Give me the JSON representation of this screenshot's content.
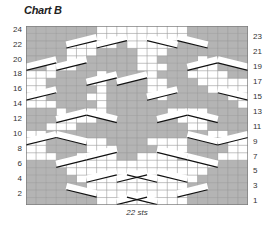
{
  "chart": {
    "title": "Chart B",
    "stitch_count_label": "22 sts",
    "columns": 22,
    "rows": 24,
    "colors": {
      "shade": "#b4b4b4",
      "background": "#ffffff",
      "grid": "#9a9a9a",
      "grid_on_shade": "#6e6e6e",
      "cable_line": "#111111"
    },
    "row_labels_left": [
      "24",
      "22",
      "20",
      "18",
      "16",
      "14",
      "12",
      "10",
      "8",
      "6",
      "4",
      "2"
    ],
    "row_labels_right": [
      "23",
      "21",
      "19",
      "17",
      "15",
      "13",
      "11",
      "9",
      "7",
      "5",
      "3",
      "1"
    ],
    "shading_rows_top_to_bottom": [
      "1111111000000000111111",
      "1111111000000000111111",
      "1111000001000001111111",
      "1111000111100011111111",
      "1111001111100111101111",
      "1100011111100011100111",
      "0001111011110111000011",
      "0011110011110011100000",
      "0011111011110011110000",
      "0011110011111011111100",
      "0001111011111111111110",
      "1110110011111100001111",
      "1110000111111110001111",
      "1100011111111111001111",
      "0011111111111111110011",
      "0011110011110000111100",
      "0011110001111000111100",
      "0001100001100001111000",
      "1110000000000000000111",
      "1111000000000000001111",
      "1111100000000000011111",
      "1111110000000000111111",
      "1111111000000000111111",
      "1111111000000000111111"
    ],
    "cable_segments": [
      [
        4,
        2.5,
        7,
        1.5
      ],
      [
        7,
        2.5,
        10,
        1.5
      ],
      [
        12,
        1.5,
        15,
        2.5
      ],
      [
        15,
        1.5,
        18,
        2.5
      ],
      [
        0,
        5.5,
        3,
        4.5
      ],
      [
        3,
        5.5,
        6,
        4.5
      ],
      [
        16,
        5.5,
        19,
        4.5
      ],
      [
        19,
        4.5,
        22,
        5.5
      ],
      [
        9,
        7.5,
        12,
        6.5
      ],
      [
        6,
        7.5,
        9,
        6.5
      ],
      [
        0,
        9.5,
        3,
        8.5
      ],
      [
        12,
        9.5,
        15,
        8.5
      ],
      [
        19,
        8.5,
        22,
        9.5
      ],
      [
        3,
        12.5,
        6,
        11.5
      ],
      [
        6,
        11.5,
        9,
        12.5
      ],
      [
        16,
        11.5,
        19,
        12.5
      ],
      [
        13,
        12.5,
        16,
        11.5
      ],
      [
        0,
        15.5,
        3,
        14.5
      ],
      [
        3,
        14.5,
        6,
        15.5
      ],
      [
        19,
        15.5,
        22,
        14.5
      ],
      [
        16,
        14.5,
        19,
        15.5
      ],
      [
        6,
        17.5,
        9,
        16.5
      ],
      [
        13,
        16.5,
        16,
        17.5
      ],
      [
        3,
        18.5,
        6,
        17.5
      ],
      [
        16,
        17.5,
        19,
        18.5
      ],
      [
        6,
        20.5,
        9,
        19.5
      ],
      [
        9,
        20.5,
        12,
        19.5
      ],
      [
        10,
        19.5,
        13,
        20.5
      ],
      [
        13,
        19.5,
        16,
        20.5
      ],
      [
        4,
        21.5,
        7,
        22.5
      ],
      [
        15,
        22.5,
        18,
        21.5
      ],
      [
        9,
        23.5,
        12,
        22.5
      ],
      [
        10,
        22.5,
        13,
        23.5
      ]
    ]
  }
}
